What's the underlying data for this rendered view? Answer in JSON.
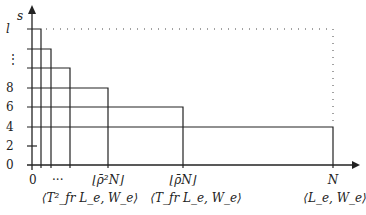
{
  "diagram": {
    "y_axis_label": "s",
    "y_ticks": [
      "l",
      "⋮",
      "8",
      "6",
      "4",
      "2",
      "0"
    ],
    "x_ticks": [
      {
        "label": "0",
        "sub": ""
      },
      {
        "label": "···",
        "sub": ""
      },
      {
        "label": "⌊ρ̄²N⌋",
        "sub": "⟨T²_fr L_e, W_e⟩"
      },
      {
        "label": "⌊ρ̄N⌋",
        "sub": "⟨T_fr L_e, W_e⟩"
      },
      {
        "label": "N",
        "sub": "⟨L_e, W_e⟩"
      }
    ],
    "boxes": [
      {
        "top_label": "l",
        "right_x": 41
      },
      {
        "top_label": "",
        "right_x": 51
      },
      {
        "top_label": "",
        "right_x": 70
      },
      {
        "top_label": "8",
        "right_x": 108
      },
      {
        "top_label": "6",
        "right_x": 183
      },
      {
        "top_label": "4",
        "right_x": 333
      }
    ]
  }
}
